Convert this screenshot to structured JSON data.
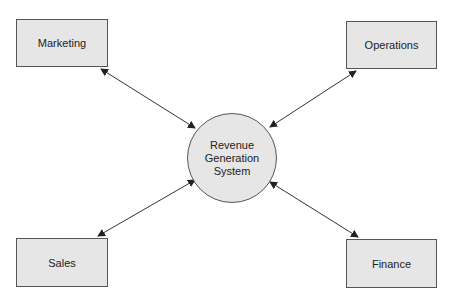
{
  "diagram": {
    "center": {
      "label": "Revenue\nGeneration\nSystem"
    },
    "nodes": [
      {
        "id": "marketing",
        "label": "Marketing"
      },
      {
        "id": "operations",
        "label": "Operations"
      },
      {
        "id": "sales",
        "label": "Sales"
      },
      {
        "id": "finance",
        "label": "Finance"
      }
    ],
    "edges": [
      {
        "from": "marketing",
        "to": "center",
        "type": "bidirectional"
      },
      {
        "from": "operations",
        "to": "center",
        "type": "bidirectional"
      },
      {
        "from": "sales",
        "to": "center",
        "type": "bidirectional"
      },
      {
        "from": "finance",
        "to": "center",
        "type": "bidirectional"
      }
    ],
    "colors": {
      "fill": "#e6e6e6",
      "stroke": "#555555",
      "text": "#222222"
    }
  }
}
